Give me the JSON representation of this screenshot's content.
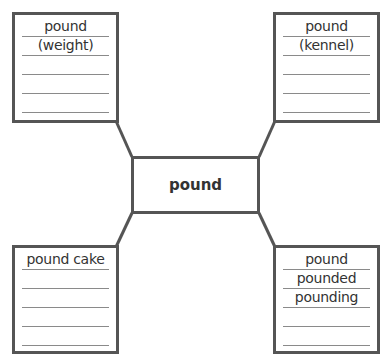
{
  "center": {
    "label": "pound"
  },
  "boxes": {
    "top_left": {
      "words": [
        "pound",
        "(weight)"
      ]
    },
    "top_right": {
      "words": [
        "pound",
        "(kennel)"
      ]
    },
    "bottom_left": {
      "words": [
        "pound cake"
      ]
    },
    "bottom_right": {
      "words": [
        "pound",
        "pounded",
        "pounding"
      ]
    }
  },
  "colors": {
    "border": "#555555",
    "rule": "#8a8a8a",
    "text": "#333333"
  }
}
